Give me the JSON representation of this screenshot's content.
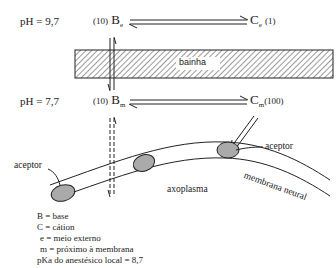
{
  "diagram": {
    "top": {
      "ph": "pH = 9,7",
      "base_conc": "(10)",
      "base_symbol": "B",
      "base_sub": "e",
      "cation_symbol": "C",
      "cation_sub": "e",
      "cation_conc": "(1)"
    },
    "sheath_label": "bainha",
    "bottom": {
      "ph": "pH = 7,7",
      "base_conc": "(10)",
      "base_symbol": "B",
      "base_sub": "m",
      "cation_symbol": "C",
      "cation_sub": "m",
      "cation_conc": "(100)"
    },
    "labels": {
      "acceptor_left": "aceptor",
      "acceptor_right": "aceptor",
      "membrane": "membrana neural",
      "axoplasm": "axoplasma"
    },
    "legend": [
      "B = base",
      "C = cátion",
      "e = meio externo",
      "m = próximo à membrana",
      "pKa do anestésico local = 8,7"
    ]
  }
}
